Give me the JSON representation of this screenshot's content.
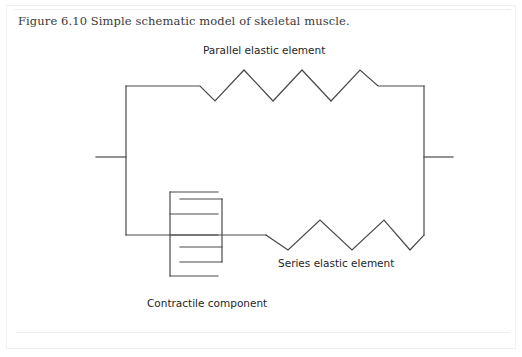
{
  "page": {
    "background_color": "#ffffff",
    "frame_color": "#f1f1f1",
    "rule_color": "#efefef"
  },
  "caption": {
    "text": "Figure 6.10  Simple schematic model of skeletal muscle."
  },
  "diagram": {
    "title": "Simple schematic model of skeletal muscle",
    "stroke_color": "#4a4a4a",
    "stroke_width": 1.2,
    "labels": {
      "parallel": "Parallel elastic element",
      "series": "Series elastic element",
      "contractile": "Contractile component"
    },
    "geometry": {
      "left_tendon_stub": {
        "x1": 96,
        "y1": 157,
        "x2": 126,
        "y2": 157
      },
      "right_tendon_stub": {
        "x1": 424,
        "y1": 157,
        "x2": 453,
        "y2": 157
      },
      "left_rail": {
        "x": 126,
        "y_top": 86,
        "y_bottom": 235
      },
      "right_rail": {
        "x": 424,
        "y_top": 86,
        "y_bottom": 235
      },
      "top_branch": {
        "name": "parallel-elastic-element",
        "baseline_y": 86,
        "lead_in_end_x": 200,
        "lead_out_start_x": 378,
        "peak_y": 70,
        "valley_y": 101,
        "peaks": 3,
        "valleys": 3
      },
      "bottom_branch": {
        "name": "series-elastic-element",
        "baseline_y": 235,
        "lead_in_end_x": 266,
        "peak_y": 220,
        "valley_y": 250,
        "peaks": 2,
        "valleys": 3
      },
      "contractile_component": {
        "name": "contractile-component",
        "left_bracket_x": 170,
        "right_bracket_x": 222,
        "left_bracket_y_top": 192,
        "left_bracket_y_bottom": 276,
        "right_bracket_y_top": 199,
        "right_bracket_y_bottom": 262,
        "left_plates_y": [
          192,
          214,
          235,
          276
        ],
        "right_plates_y": [
          199,
          235,
          247,
          262
        ],
        "plate_extent_x": 218
      }
    }
  }
}
